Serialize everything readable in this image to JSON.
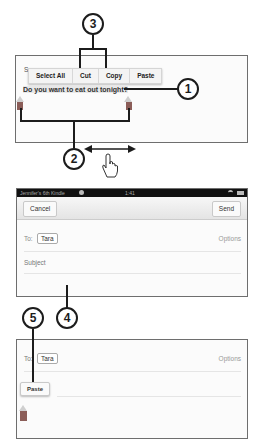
{
  "callouts": [
    "1",
    "2",
    "3",
    "4",
    "5"
  ],
  "panel1": {
    "partial_label": "S",
    "context_menu": [
      "Select All",
      "Cut",
      "Copy",
      "Paste"
    ],
    "selected_text": "Do you want to eat out tonight?"
  },
  "panel2": {
    "status_bar": {
      "device_name": "Jennifer's 6th Kindle",
      "time": "1:41"
    },
    "cancel_label": "Cancel",
    "send_label": "Send",
    "to_label": "To:",
    "recipient": "Tara",
    "options_label": "Options",
    "subject_placeholder": "Subject"
  },
  "panel3": {
    "to_label": "To:",
    "recipient": "Tara",
    "options_label": "Options",
    "paste_label": "Paste"
  },
  "colors": {
    "handle": "#8b5d58",
    "status_bar": "#111111",
    "callout_stroke": "#1c1c1c"
  }
}
